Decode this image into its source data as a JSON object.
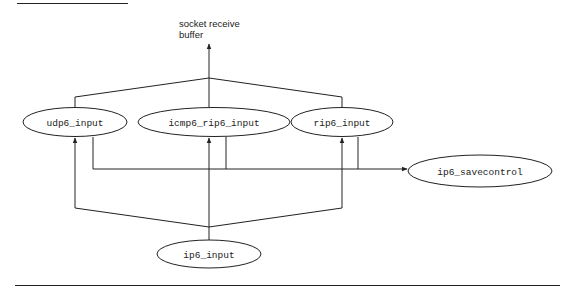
{
  "diagram": {
    "type": "flow",
    "caption": {
      "line1": "socket receive",
      "line2": "buffer"
    },
    "nodes": [
      {
        "id": "udp6_input",
        "label": "udp6_input"
      },
      {
        "id": "icmp6_rip6_input",
        "label": "icmp6_rip6_input"
      },
      {
        "id": "rip6_input",
        "label": "rip6_input"
      },
      {
        "id": "ip6_savecontrol",
        "label": "ip6_savecontrol"
      },
      {
        "id": "ip6_input",
        "label": "ip6_input"
      }
    ],
    "edges": [
      {
        "from": "ip6_input",
        "to": "udp6_input"
      },
      {
        "from": "ip6_input",
        "to": "icmp6_rip6_input"
      },
      {
        "from": "ip6_input",
        "to": "rip6_input"
      },
      {
        "from": "udp6_input",
        "to": "ip6_savecontrol"
      },
      {
        "from": "icmp6_rip6_input",
        "to": "ip6_savecontrol"
      },
      {
        "from": "rip6_input",
        "to": "ip6_savecontrol"
      },
      {
        "from": "udp6_input",
        "to": "socket receive buffer"
      },
      {
        "from": "icmp6_rip6_input",
        "to": "socket receive buffer"
      },
      {
        "from": "rip6_input",
        "to": "socket receive buffer"
      }
    ]
  }
}
